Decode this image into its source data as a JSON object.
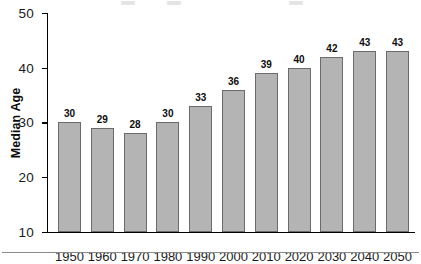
{
  "figure": {
    "y_axis_title": "Median Age",
    "footer_rule": "horizontal-divider"
  },
  "chart_data": {
    "type": "bar",
    "title": "",
    "xlabel": "",
    "ylabel": "Median Age",
    "categories": [
      "1950",
      "1960",
      "1970",
      "1980",
      "1990",
      "2000",
      "2010",
      "2020",
      "2030",
      "2040",
      "2050"
    ],
    "values": [
      30,
      29,
      28,
      30,
      33,
      36,
      39,
      40,
      42,
      43,
      43
    ],
    "value_labels": [
      "30",
      "29",
      "28",
      "30",
      "33",
      "36",
      "39",
      "40",
      "42",
      "43",
      "43"
    ],
    "ylim": [
      10,
      50
    ],
    "yticks": [
      10,
      20,
      30,
      40,
      50
    ],
    "ytick_labels": [
      "10",
      "20",
      "30",
      "40",
      "50"
    ],
    "grid": false,
    "legend": null,
    "bar_color": "#b4b4b4",
    "bar_edge_color": "#6b6b6b",
    "axis_color": "#000000"
  }
}
